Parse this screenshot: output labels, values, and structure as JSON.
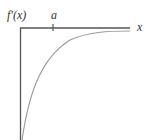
{
  "diagram": {
    "y_axis_label": "f′(x)",
    "x_axis_label": "x",
    "tick_label": "a",
    "curve_description": "f′(x) negative, increasing, approaching 0 asymptotically from below",
    "colors": {
      "axis": "#555555",
      "curve": "#9a9a9a",
      "text": "#333333",
      "background": "#ffffff"
    }
  }
}
